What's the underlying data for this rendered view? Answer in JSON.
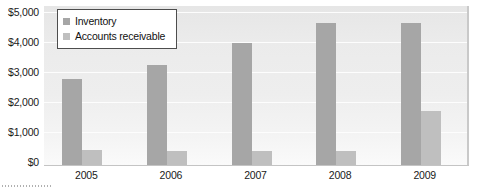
{
  "chart_data": {
    "type": "bar",
    "title": "",
    "subtitle": "",
    "xlabel": "",
    "ylabel": "",
    "categories": [
      "2005",
      "2006",
      "2007",
      "2008",
      "2009"
    ],
    "series": [
      {
        "name": "Inventory",
        "color": "#a6a6a6",
        "values": [
          2880,
          3350,
          4080,
          4750,
          4750
        ]
      },
      {
        "name": "Accounts receivable",
        "color": "#bfbfbf",
        "values": [
          500,
          480,
          470,
          470,
          1800
        ]
      }
    ],
    "ylim": [
      0,
      5000
    ],
    "ytick_values": [
      5000,
      4000,
      3000,
      2000,
      1000,
      0
    ],
    "ytick_labels": [
      "$5,000",
      "$4,000",
      "$3,000",
      "$2,000",
      "$1,000",
      "$0"
    ],
    "grid": true,
    "grid_axis": "y",
    "legend_position": "top-left",
    "currency_symbol": "$",
    "bar_grouping": "grouped",
    "annotations": []
  },
  "legend": {
    "items": [
      {
        "label": "Inventory",
        "swatch_color": "#a6a6a6"
      },
      {
        "label": "Accounts receivable",
        "swatch_color": "#bfbfbf"
      }
    ]
  },
  "axes": {
    "y_labels": [
      "$5,000",
      "$4,000",
      "$3,000",
      "$2,000",
      "$1,000",
      "$0"
    ],
    "x_labels": [
      "2005",
      "2006",
      "2007",
      "2008",
      "2009"
    ]
  },
  "colors": {
    "inventory": "#a6a6a6",
    "receivable": "#bfbfbf",
    "plot_background": "#ededed",
    "gridline": "#fdfdfd",
    "axis_text": "#1a1a1a",
    "legend_border": "#4d4d4d"
  }
}
